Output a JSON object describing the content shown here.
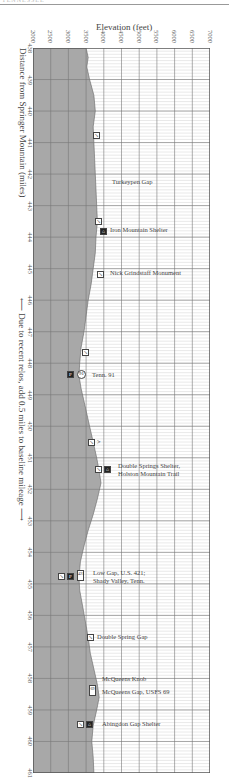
{
  "header": {
    "text": "TENNESSEE"
  },
  "chart_data": {
    "type": "area",
    "title": "Elevation (feet)",
    "xlabel": "Elevation (feet)",
    "ylabel": "Distance from Springer Mountain (miles)",
    "orientation": "vertical profile (distance runs top to bottom, elevation runs left to right)",
    "values_are_estimates": true,
    "elevation_ticks": [
      2000,
      2500,
      3000,
      3500,
      4000,
      4500,
      5000,
      5500,
      6000,
      6500,
      7000
    ],
    "elevation_range": [
      2000,
      7000
    ],
    "distance_ticks": [
      438,
      439,
      440,
      441,
      442,
      443,
      444,
      445,
      446,
      447,
      448,
      449,
      450,
      451,
      452,
      453,
      454,
      455,
      456,
      457,
      458,
      459,
      460,
      461
    ],
    "distance_range": [
      438,
      461
    ],
    "grid": true,
    "profile": [
      {
        "mile": 438.0,
        "elev": 3500
      },
      {
        "mile": 438.3,
        "elev": 3560
      },
      {
        "mile": 438.6,
        "elev": 3520
      },
      {
        "mile": 439.0,
        "elev": 3600
      },
      {
        "mile": 439.5,
        "elev": 3720
      },
      {
        "mile": 440.0,
        "elev": 3760
      },
      {
        "mile": 440.5,
        "elev": 3700
      },
      {
        "mile": 441.0,
        "elev": 3720
      },
      {
        "mile": 441.5,
        "elev": 3740
      },
      {
        "mile": 442.0,
        "elev": 3760
      },
      {
        "mile": 442.5,
        "elev": 3780
      },
      {
        "mile": 443.0,
        "elev": 3800
      },
      {
        "mile": 443.5,
        "elev": 3820
      },
      {
        "mile": 444.0,
        "elev": 3780
      },
      {
        "mile": 444.5,
        "elev": 3760
      },
      {
        "mile": 445.0,
        "elev": 3700
      },
      {
        "mile": 445.5,
        "elev": 3640
      },
      {
        "mile": 446.0,
        "elev": 3560
      },
      {
        "mile": 446.5,
        "elev": 3500
      },
      {
        "mile": 447.0,
        "elev": 3440
      },
      {
        "mile": 447.5,
        "elev": 3360
      },
      {
        "mile": 448.0,
        "elev": 3320
      },
      {
        "mile": 448.4,
        "elev": 3300
      },
      {
        "mile": 448.8,
        "elev": 3360
      },
      {
        "mile": 449.5,
        "elev": 3500
      },
      {
        "mile": 450.0,
        "elev": 3600
      },
      {
        "mile": 450.5,
        "elev": 3700
      },
      {
        "mile": 451.0,
        "elev": 3800
      },
      {
        "mile": 451.5,
        "elev": 3880
      },
      {
        "mile": 451.8,
        "elev": 3920
      },
      {
        "mile": 452.3,
        "elev": 3820
      },
      {
        "mile": 452.8,
        "elev": 3700
      },
      {
        "mile": 453.3,
        "elev": 3560
      },
      {
        "mile": 453.8,
        "elev": 3440
      },
      {
        "mile": 454.3,
        "elev": 3340
      },
      {
        "mile": 454.8,
        "elev": 3300
      },
      {
        "mile": 455.2,
        "elev": 3320
      },
      {
        "mile": 455.7,
        "elev": 3400
      },
      {
        "mile": 456.2,
        "elev": 3480
      },
      {
        "mile": 456.7,
        "elev": 3560
      },
      {
        "mile": 457.2,
        "elev": 3620
      },
      {
        "mile": 457.7,
        "elev": 3720
      },
      {
        "mile": 458.2,
        "elev": 3820
      },
      {
        "mile": 458.6,
        "elev": 3870
      },
      {
        "mile": 459.0,
        "elev": 3800
      },
      {
        "mile": 459.5,
        "elev": 3700
      },
      {
        "mile": 460.0,
        "elev": 3660
      },
      {
        "mile": 460.5,
        "elev": 3700
      },
      {
        "mile": 461.0,
        "elev": 3720
      }
    ],
    "annotations": [
      {
        "mile": 441.7,
        "label": "",
        "icons": [
          "sign"
        ]
      },
      {
        "mile": 442.5,
        "label": "Turkeypen Gap",
        "icons": []
      },
      {
        "mile": 443.8,
        "label": "",
        "icons": [
          "sign"
        ]
      },
      {
        "mile": 444.1,
        "label": "Iron Mountain Shelter",
        "icons": [
          "shelter"
        ]
      },
      {
        "mile": 445.1,
        "label": "Nick Grindstaff Monument",
        "icons": [
          "sign"
        ]
      },
      {
        "mile": 447.8,
        "label": "",
        "icons": [
          "sign"
        ]
      },
      {
        "mile": 448.6,
        "label": "Tenn. 91",
        "icons": [
          "parking",
          "road-91"
        ]
      },
      {
        "mile": 450.8,
        "label": "",
        "icons": [
          "sign",
          "view"
        ]
      },
      {
        "mile": 451.7,
        "label": "Double Springs Shelter, Holston Mountain Trail",
        "icons": [
          "sign",
          "shelter"
        ]
      },
      {
        "mile": 455.1,
        "label": "Low Gap, U.S. 421; Shady Valley, Tenn.",
        "icons": [
          "sign",
          "parking",
          "road-421"
        ]
      },
      {
        "mile": 456.9,
        "label": "Double Spring Gap",
        "icons": [
          "sign"
        ]
      },
      {
        "mile": 458.3,
        "label": "McQueens Knob",
        "icons": []
      },
      {
        "mile": 458.8,
        "label": "McQueens Gap, USFS 69",
        "icons": [
          "road-69"
        ]
      },
      {
        "mile": 459.9,
        "label": "Abingdon Gap Shelter",
        "icons": [
          "sign",
          "shelter"
        ]
      }
    ],
    "notes": [
      "← Due to recent relos, add 0.5 miles to baseline mileage →"
    ]
  },
  "axis": {
    "elev_title": "Elevation (feet)",
    "dist_title": "Distance from Springer Mountain (miles)",
    "relo_note": "⟵ Due to recent relos, add 0.5 miles to baseline mileage ⟶"
  },
  "labels": {
    "turkeypen": "Turkeypen Gap",
    "iron_mtn": "Iron Mountain Shelter",
    "nick": "Nick Grindstaff Monument",
    "tenn91": "Tenn. 91",
    "double_springs_1": "Double Springs Shelter,",
    "double_springs_2": "Holston Mountain Trail",
    "low_gap_1": "Low Gap, U.S. 421;",
    "low_gap_2": "Shady Valley, Tenn.",
    "double_spring_gap": "Double Spring Gap",
    "mcqueens_knob": "McQueens Knob",
    "mcqueens_gap": "McQueens Gap, USFS 69",
    "abingdon": "Abingdon Gap Shelter"
  },
  "icons": {
    "sign": "↘",
    "shelter": "⌂",
    "parking": "P",
    "view": ">",
    "road91": "91",
    "road421": "421",
    "road69": "69"
  },
  "colors": {
    "profile_fill": "#a8a8a8",
    "grid_major": "#777777",
    "grid_minor": "#c8c8c8",
    "text": "#444444"
  }
}
